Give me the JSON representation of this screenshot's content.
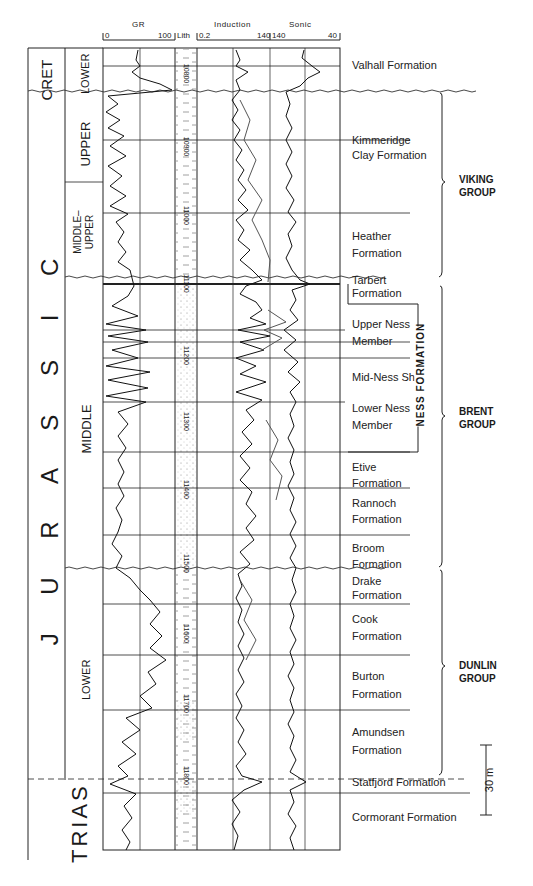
{
  "header": {
    "corner_text": "",
    "tracks": [
      {
        "name": "GR",
        "min": "0",
        "max": "100"
      },
      {
        "name": "Lith"
      },
      {
        "name": "Induction",
        "min": "0.2",
        "max": "140"
      },
      {
        "name": "Sonic",
        "min": "140",
        "max": "40"
      }
    ]
  },
  "systems": [
    {
      "label": "CRET"
    },
    {
      "label": "J U R A S S I C"
    },
    {
      "label": "TRIAS"
    }
  ],
  "series": [
    {
      "label": "LOWER"
    },
    {
      "label": "UPPER"
    },
    {
      "label": "MIDDLE– UPPER"
    },
    {
      "label": "MIDDLE"
    },
    {
      "label": "LOWER"
    }
  ],
  "depths": [
    "10800",
    "10900",
    "11000",
    "11100",
    "11200",
    "11300",
    "11400",
    "11500",
    "11600",
    "11700",
    "11800"
  ],
  "formations": [
    {
      "label": "Valhall Formation"
    },
    {
      "label": "Kimmeridge Clay Formation"
    },
    {
      "label": "Heather Formation"
    },
    {
      "label": "Tarbert Formation"
    },
    {
      "label": "Upper Ness Member"
    },
    {
      "label": "Mid-Ness Sh."
    },
    {
      "label": "Lower Ness Member"
    },
    {
      "label": "Etive Formation"
    },
    {
      "label": "Rannoch Formation"
    },
    {
      "label": "Broom Formation"
    },
    {
      "label": "Drake Formation"
    },
    {
      "label": "Cook Formation"
    },
    {
      "label": "Burton Formation"
    },
    {
      "label": "Amundsen Formation"
    },
    {
      "label": "Statfjord Formation"
    },
    {
      "label": "Cormorant Formation"
    }
  ],
  "groups": [
    {
      "label": "VIKING GROUP"
    },
    {
      "label": "NESS FORMATION"
    },
    {
      "label": "BRENT GROUP"
    },
    {
      "label": "DUNLIN GROUP"
    }
  ],
  "scale_bar": {
    "label": "30 m"
  }
}
